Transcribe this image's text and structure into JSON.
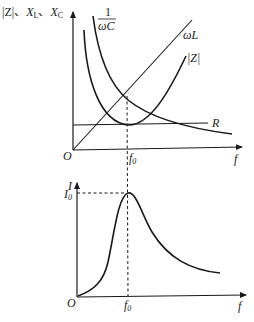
{
  "top_chart": {
    "y_axis_label": {
      "abs_z": "|Z|",
      "sep1": "、",
      "xl": "X",
      "xl_sub": "L",
      "sep2": "、",
      "xc": "X",
      "xc_sub": "C"
    },
    "x_axis_label": "f",
    "origin": "O",
    "f0": {
      "main": "f",
      "sub": "0"
    },
    "curves": {
      "capacitive": {
        "num": "1",
        "den": "ωC"
      },
      "inductive": "ωL",
      "impedance": "|Z|",
      "resistance": "R"
    }
  },
  "bottom_chart": {
    "y_axis_label": "I",
    "i0": {
      "main": "I",
      "sub": "0"
    },
    "x_axis_label": "f",
    "origin": "O",
    "f0": {
      "main": "f",
      "sub": "0"
    },
    "curve": "resonance current curve"
  }
}
